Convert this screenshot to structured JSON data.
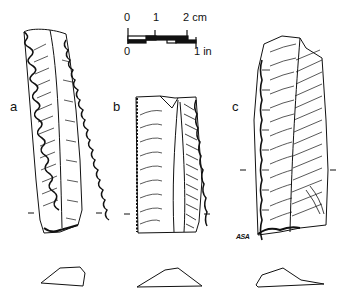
{
  "figure": {
    "type": "archaeological illustration of flaked stone blades",
    "background": "#ffffff",
    "ink_color": "#111111"
  },
  "scale_bar": {
    "top_labels": [
      "0",
      "1",
      "2 cm"
    ],
    "bottom_labels": [
      "0",
      "1 in"
    ]
  },
  "artifacts": [
    {
      "id": "a",
      "label": "a",
      "description": "long blade with denticulate (serrated) left edge"
    },
    {
      "id": "b",
      "label": "b",
      "description": "truncated blade segment with ridge"
    },
    {
      "id": "c",
      "label": "c",
      "description": "blade with retouched edges"
    }
  ],
  "signature": "ASA"
}
